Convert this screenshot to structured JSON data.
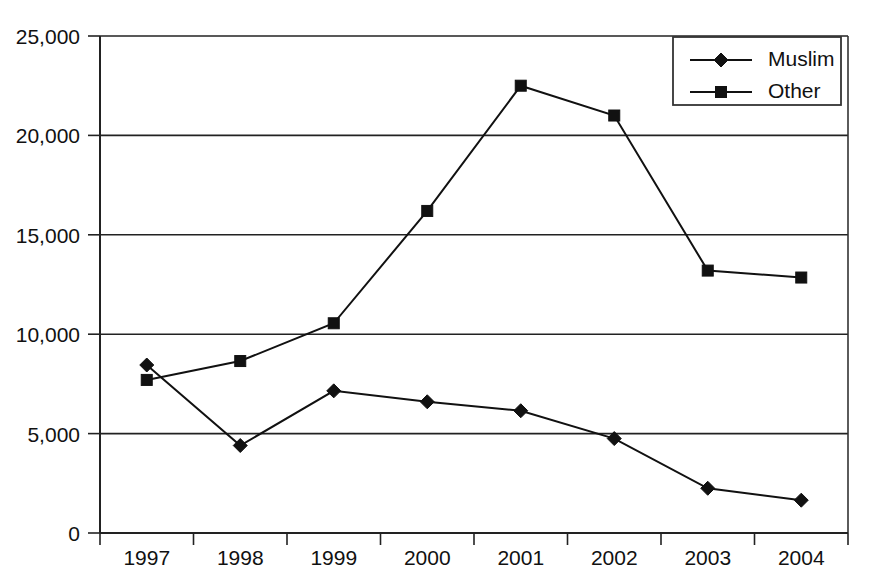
{
  "chart_data": {
    "type": "line",
    "title": "",
    "xlabel": "",
    "ylabel": "",
    "categories": [
      "1997",
      "1998",
      "1999",
      "2000",
      "2001",
      "2002",
      "2003",
      "2004"
    ],
    "ylim": [
      0,
      25000
    ],
    "ytick_labels": [
      "25,000",
      "20,000",
      "15,000",
      "10,000",
      "5,000",
      "0"
    ],
    "ytick_values": [
      25000,
      20000,
      15000,
      10000,
      5000,
      0
    ],
    "grid": "horizontal",
    "legend_position": "top-right",
    "series": [
      {
        "name": "Muslim",
        "marker": "diamond",
        "color": "#111111",
        "values": [
          8450,
          4400,
          7150,
          6600,
          6150,
          4750,
          2250,
          1650
        ]
      },
      {
        "name": "Other",
        "marker": "square",
        "color": "#111111",
        "values": [
          7700,
          8650,
          10550,
          16200,
          22500,
          21000,
          13200,
          12850
        ]
      }
    ]
  },
  "legend": {
    "items": [
      {
        "label": "Muslim",
        "marker": "diamond"
      },
      {
        "label": "Other",
        "marker": "square"
      }
    ]
  },
  "colors": {
    "ink": "#111111",
    "axis": "#222222",
    "background": "#ffffff"
  }
}
